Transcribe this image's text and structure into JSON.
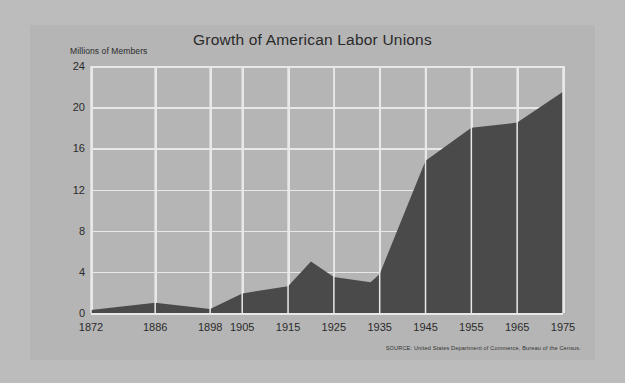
{
  "card": {
    "background_color": "#b5b5b5",
    "page_background_color": "#bcbcbc"
  },
  "chart_data": {
    "type": "area",
    "title": "Growth of American Labor Unions",
    "ylabel": "Millions of Members",
    "xlabel": "",
    "ylim": [
      0,
      24
    ],
    "yticks": [
      0,
      4,
      8,
      12,
      16,
      20,
      24
    ],
    "ytick_labels": [
      "0",
      "4",
      "8",
      "12",
      "16",
      "20",
      "24"
    ],
    "categories": [
      "1872",
      "1886",
      "1898",
      "1905",
      "1915",
      "1925",
      "1935",
      "1945",
      "1955",
      "1965",
      "1975"
    ],
    "x": [
      1872,
      1886,
      1898,
      1905,
      1915,
      1925,
      1935,
      1945,
      1955,
      1965,
      1975
    ],
    "xtick_labels": [
      "1872",
      "1886",
      "1898",
      "1905",
      "1915",
      "1925",
      "1935",
      "1945",
      "1955",
      "1965",
      "1975"
    ],
    "values": [
      0.3,
      1.0,
      0.4,
      1.9,
      2.6,
      3.5,
      3.8,
      14.8,
      18.0,
      18.5,
      21.5
    ],
    "interior_points": [
      {
        "x": 1920,
        "value": 5.0,
        "note": "post-WWI peak"
      },
      {
        "x": 1933,
        "value": 3.0,
        "note": "Depression trough"
      }
    ],
    "series": [
      {
        "name": "Union membership",
        "values": [
          0.3,
          1.0,
          0.4,
          1.9,
          2.6,
          3.5,
          3.8,
          14.8,
          18.0,
          18.5,
          21.5
        ]
      }
    ],
    "grid": true,
    "gridline_color": "#e8e8e8",
    "area_color": "#4a4a4a",
    "legend": "none",
    "legend_position": "none",
    "units": "millions of members",
    "source": "SOURCE: United States Department of Commerce, Bureau of the Census."
  }
}
